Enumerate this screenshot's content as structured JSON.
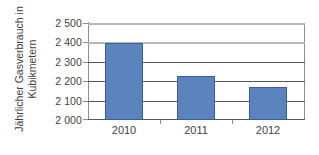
{
  "chart_data": {
    "type": "bar",
    "title": "",
    "subtitle": "",
    "xlabel": "",
    "ylabel": "Jährlicher Gasverbrauch in Kubikmetern",
    "ylabel_lines": [
      "Jährlicher Gasverbrauch in",
      "Kubikmetern"
    ],
    "categories": [
      "2010",
      "2011",
      "2012"
    ],
    "values": [
      2400,
      2230,
      2170
    ],
    "series": [
      {
        "name": "Jährlicher Gasverbrauch",
        "values": [
          2400,
          2230,
          2170
        ]
      }
    ],
    "ylim": [
      2000,
      2500
    ],
    "ytick_values": [
      2000,
      2100,
      2200,
      2300,
      2400,
      2500
    ],
    "ytick_labels": [
      "2 000",
      "2 100",
      "2 200",
      "2 300",
      "2 400",
      "2 500"
    ],
    "grid": true,
    "grid_axis": "y",
    "legend": false,
    "legend_position": "none",
    "bar_color": "#5b84be",
    "bar_border_color": "#3f5f92",
    "gridline_color": "#555555",
    "major_gridline_color": "#b6b6b6",
    "axis_color": "#8e8e8e",
    "text_color": "#3f3f3f",
    "background_color": "#ffffff",
    "annotations": []
  }
}
